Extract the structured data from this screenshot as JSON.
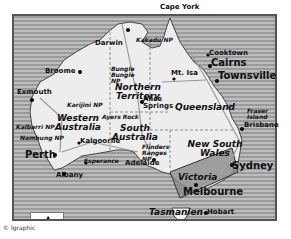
{
  "map": {
    "title": "Australia",
    "colors": {
      "sea": "#aaaaaa",
      "land": "#eeeeee",
      "highlight": "#7f7f7f",
      "border": "#555555"
    },
    "regions": [
      {
        "label": "Northern Territory"
      },
      {
        "label": "Western Australia"
      },
      {
        "label": "South Australia"
      },
      {
        "label": "Queensland"
      },
      {
        "label": "New South Wales"
      },
      {
        "label": "Victoria"
      },
      {
        "label": "Tasmanien"
      }
    ],
    "cities": [
      {
        "label": "Darwin"
      },
      {
        "label": "Broome"
      },
      {
        "label": "Exmouth"
      },
      {
        "label": "Perth"
      },
      {
        "label": "Albany"
      },
      {
        "label": "Kalgoorlie"
      },
      {
        "label": "Esperance"
      },
      {
        "label": "Adelaide"
      },
      {
        "label": "Alice Springs"
      },
      {
        "label": "Mt. Isa"
      },
      {
        "label": "Cooktown"
      },
      {
        "label": "Cairns"
      },
      {
        "label": "Townsville"
      },
      {
        "label": "Brisbane"
      },
      {
        "label": "Sydney"
      },
      {
        "label": "Melbourne"
      },
      {
        "label": "Hobart"
      }
    ],
    "parks": [
      {
        "label": "Kakadu NP"
      },
      {
        "label": "Bungle Bungle NP"
      },
      {
        "label": "Karijini NP"
      },
      {
        "label": "Kalbarri NP"
      },
      {
        "label": "Nambung NP"
      },
      {
        "label": "Ayers Rock"
      },
      {
        "label": "Flinders Ranges NP"
      }
    ],
    "features": [
      {
        "label": "Cape York"
      },
      {
        "label": "Fraser Island"
      }
    ],
    "scale": {
      "start": "0",
      "end": "500 km",
      "north_arrow": "N"
    },
    "copyright": "© Igraphic"
  }
}
